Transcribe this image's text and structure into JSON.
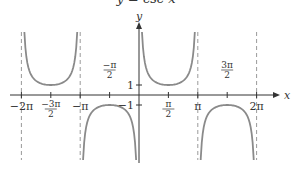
{
  "chart_data": {
    "type": "line",
    "title": "y = csc x",
    "xlabel": "x",
    "ylabel": "y",
    "function": "csc",
    "xlim": [
      -6.6,
      7.5
    ],
    "ylim": [
      -6.5,
      6.5
    ],
    "x_ticks": [
      {
        "value": -6.2832,
        "label_main": "−2",
        "label_pi": "π",
        "frac": false
      },
      {
        "value": -4.7124,
        "label_num": "−3π",
        "label_den": "2",
        "frac": true
      },
      {
        "value": -3.1416,
        "label_main": "−",
        "label_pi": "π",
        "frac": false
      },
      {
        "value": -1.5708,
        "label_num": "−π",
        "label_den": "2",
        "frac": true,
        "above": true
      },
      {
        "value": 1.5708,
        "label_num": "π",
        "label_den": "2",
        "frac": true
      },
      {
        "value": 3.1416,
        "label_main": "",
        "label_pi": "π",
        "frac": false
      },
      {
        "value": 4.7124,
        "label_num": "3π",
        "label_den": "2",
        "frac": true,
        "above": true
      },
      {
        "value": 6.2832,
        "label_main": "2",
        "label_pi": "π",
        "frac": false
      }
    ],
    "y_ticks": [
      {
        "value": 1,
        "label": "1"
      },
      {
        "value": -1,
        "label": "−1"
      }
    ],
    "asymptotes": [
      -6.2832,
      -3.1416,
      0,
      3.1416,
      6.2832
    ],
    "series": [
      {
        "name": "csc x",
        "domain": [
          -6.2832,
          6.2832
        ],
        "samples_per_branch": 60
      }
    ],
    "grid": false,
    "legend": null
  },
  "colors": {
    "axis": "#333333",
    "curve": "#8a8a8a",
    "asymptote": "#9a9a9a",
    "text": "#333333"
  },
  "layout": {
    "origin_x": 139,
    "origin_y": 95,
    "px_per_pi": 58.8,
    "px_per_unit_y": 10,
    "plot_top": 32,
    "plot_bottom": 160,
    "x_axis_left": 10,
    "x_axis_right": 280,
    "y_axis_top": 22,
    "y_axis_bottom": 163
  }
}
